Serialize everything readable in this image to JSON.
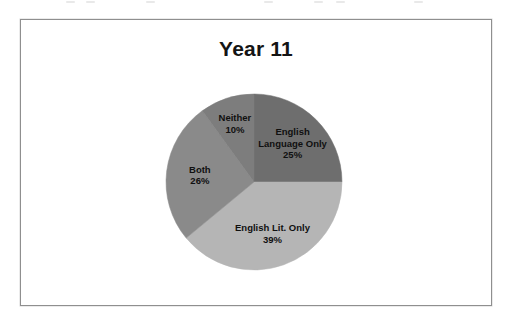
{
  "chart_data": {
    "type": "pie",
    "title": "Year 11",
    "xlabel": "",
    "ylabel": "",
    "categories": [
      "English Language Only",
      "English Lit. Only",
      "Both",
      "Neither"
    ],
    "values": [
      25,
      39,
      26,
      10
    ],
    "value_unit": "%",
    "legend": "none",
    "grid": false,
    "start_angle_deg": 0,
    "direction": "clockwise",
    "slices": [
      {
        "label": "English Language Only",
        "label_lines": [
          "English",
          "Language Only",
          "25%"
        ],
        "value": 25,
        "value_text": "25%",
        "color": "#6e6e6e"
      },
      {
        "label": "English Lit. Only",
        "label_lines": [
          "English Lit. Only",
          "39%"
        ],
        "value": 39,
        "value_text": "39%",
        "color": "#b5b5b5"
      },
      {
        "label": "Both",
        "label_lines": [
          "Both",
          "26%"
        ],
        "value": 26,
        "value_text": "26%",
        "color": "#8a8a8a"
      },
      {
        "label": "Neither",
        "label_lines": [
          "Neither",
          "10%"
        ],
        "value": 10,
        "value_text": "10%",
        "color": "#7d7d7d"
      }
    ]
  },
  "frame": {
    "border_color": "#8f8f8f",
    "background": "#ffffff"
  },
  "geometry": {
    "center_x": 233,
    "center_y": 162,
    "radius": 88,
    "label_radius_factor": 0.62
  }
}
